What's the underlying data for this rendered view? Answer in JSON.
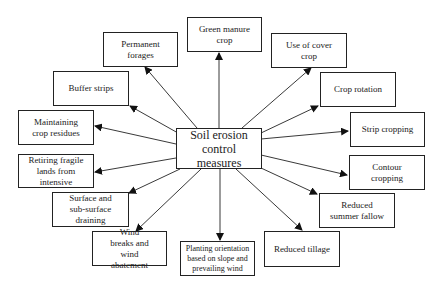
{
  "center": {
    "id": "center",
    "label": "Soil erosion control measures"
  },
  "measures": [
    {
      "id": "green-manure-crop",
      "label": "Green manure crop"
    },
    {
      "id": "permanent-forages",
      "label": "Permanent forages"
    },
    {
      "id": "use-of-cover-crop",
      "label": "Use of cover crop"
    },
    {
      "id": "buffer-strips",
      "label": "Buffer strips"
    },
    {
      "id": "crop-rotation",
      "label": "Crop rotation"
    },
    {
      "id": "maintaining-crop-residues",
      "label": "Maintaining crop residues"
    },
    {
      "id": "strip-cropping",
      "label": "Strip cropping"
    },
    {
      "id": "retiring-fragile-lands",
      "label": "Retiring fragile lands from intensive"
    },
    {
      "id": "contour-cropping",
      "label": "Contour cropping"
    },
    {
      "id": "surface-sub-surface-draining",
      "label": "Surface and sub-surface draining"
    },
    {
      "id": "reduced-summer-fallow",
      "label": "Reduced summer fallow"
    },
    {
      "id": "wind-breaks",
      "label": "Wind breaks and wind abatement"
    },
    {
      "id": "planting-orientation",
      "label": "Planting orientation based on slope and prevailing wind"
    },
    {
      "id": "reduced-tillage",
      "label": "Reduced tillage"
    }
  ],
  "edges": [
    {
      "from": "center",
      "to": "green-manure-crop"
    },
    {
      "from": "center",
      "to": "permanent-forages"
    },
    {
      "from": "center",
      "to": "use-of-cover-crop"
    },
    {
      "from": "center",
      "to": "buffer-strips"
    },
    {
      "from": "center",
      "to": "crop-rotation"
    },
    {
      "from": "center",
      "to": "maintaining-crop-residues"
    },
    {
      "from": "center",
      "to": "strip-cropping"
    },
    {
      "from": "center",
      "to": "retiring-fragile-lands"
    },
    {
      "from": "center",
      "to": "contour-cropping"
    },
    {
      "from": "center",
      "to": "surface-sub-surface-draining"
    },
    {
      "from": "center",
      "to": "reduced-summer-fallow"
    },
    {
      "from": "center",
      "to": "wind-breaks"
    },
    {
      "from": "center",
      "to": "planting-orientation"
    },
    {
      "from": "center",
      "to": "reduced-tillage"
    }
  ]
}
